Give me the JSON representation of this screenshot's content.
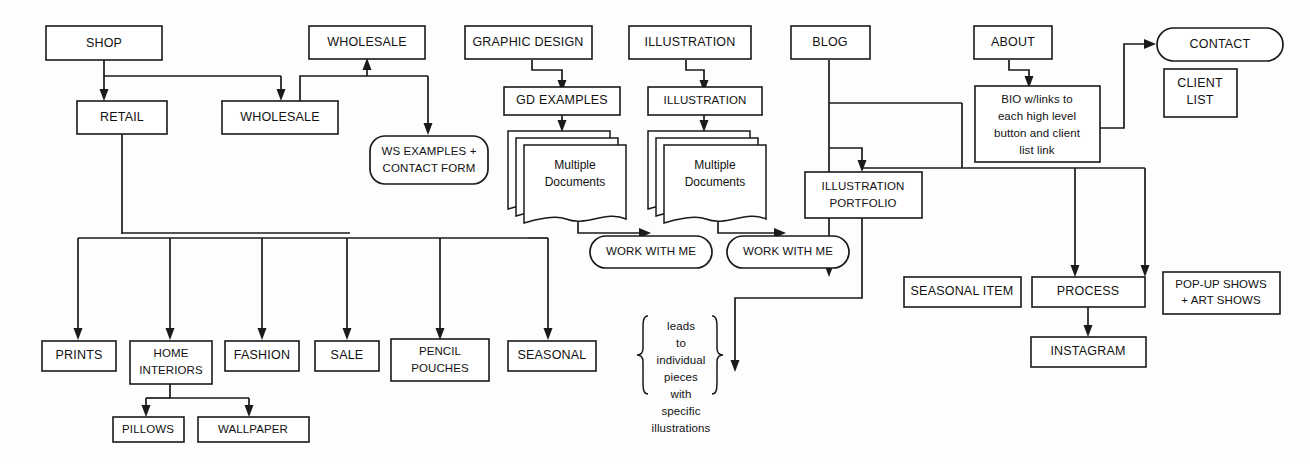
{
  "diagram": {
    "type": "flowchart",
    "background_color": "#fdfdfd",
    "line_color": "#1a1a1a",
    "text_color": "#111111"
  },
  "nodes": {
    "shop": "SHOP",
    "wholesale_top": "WHOLESALE",
    "graphic_design": "GRAPHIC DESIGN",
    "illustration_top": "ILLUSTRATION",
    "blog": "BLOG",
    "about": "ABOUT",
    "contact": "CONTACT",
    "retail": "RETAIL",
    "wholesale_second": "WHOLESALE",
    "gd_examples": "GD EXAMPLES",
    "illustration_second": "ILLUSTRATION",
    "bio_line1": "BIO w/links to",
    "bio_line2": "each high level",
    "bio_line3": "button and client",
    "bio_line4": "list link",
    "client_list_line1": "CLIENT",
    "client_list_line2": "LIST",
    "ws_examples_line1": "WS EXAMPLES +",
    "ws_examples_line2": "CONTACT FORM",
    "multiple_docs_gd_line1": "Multiple",
    "multiple_docs_gd_line2": "Documents",
    "multiple_docs_il_line1": "Multiple",
    "multiple_docs_il_line2": "Documents",
    "illustration_portfolio_line1": "ILLUSTRATION",
    "illustration_portfolio_line2": "PORTFOLIO",
    "work_with_me_gd": "WORK WITH ME",
    "work_with_me_il": "WORK WITH ME",
    "seasonal_item": "SEASONAL ITEM",
    "process": "PROCESS",
    "popup_shows_line1": "POP-UP SHOWS",
    "popup_shows_line2": "+ ART SHOWS",
    "instagram": "INSTAGRAM",
    "prints": "PRINTS",
    "home_interiors_line1": "HOME",
    "home_interiors_line2": "INTERIORS",
    "fashion": "FASHION",
    "sale": "SALE",
    "pencil_pouches_line1": "PENCIL",
    "pencil_pouches_line2": "POUCHES",
    "seasonal": "SEASONAL",
    "pillows": "PILLOWS",
    "wallpaper": "WALLPAPER",
    "brace_note_line1": "leads",
    "brace_note_line2": "to",
    "brace_note_line3": "individual",
    "brace_note_line4": "pieces",
    "brace_note_line5": "with",
    "brace_note_line6": "specific",
    "brace_note_line7": "illustrations"
  },
  "edges": [
    {
      "from": "SHOP",
      "to": "RETAIL"
    },
    {
      "from": "SHOP",
      "to": "WHOLESALE"
    },
    {
      "from": "WHOLESALE",
      "to": "WHOLESALE (top)"
    },
    {
      "from": "WHOLESALE",
      "to": "WS EXAMPLES + CONTACT FORM"
    },
    {
      "from": "GRAPHIC DESIGN",
      "to": "GD EXAMPLES"
    },
    {
      "from": "GD EXAMPLES",
      "to": "Multiple Documents"
    },
    {
      "from": "Multiple Documents",
      "to": "WORK WITH ME"
    },
    {
      "from": "ILLUSTRATION",
      "to": "ILLUSTRATION"
    },
    {
      "from": "ILLUSTRATION",
      "to": "Multiple Documents"
    },
    {
      "from": "Multiple Documents",
      "to": "WORK WITH ME"
    },
    {
      "from": "BLOG",
      "to": "ILLUSTRATION PORTFOLIO"
    },
    {
      "from": "BLOG",
      "to": "SEASONAL ITEM"
    },
    {
      "from": "ABOUT",
      "to": "BIO w/links to each high level button and client list link"
    },
    {
      "from": "BIO w/links to each high level button and client list link",
      "to": "CONTACT"
    },
    {
      "from": "BIO w/links to each high level button and client list link",
      "to": "PROCESS"
    },
    {
      "from": "BIO w/links to each high level button and client list link",
      "to": "POP-UP SHOWS + ART SHOWS"
    },
    {
      "from": "PROCESS",
      "to": "INSTAGRAM"
    },
    {
      "from": "ILLUSTRATION PORTFOLIO",
      "to": "leads to individual pieces with specific illustrations"
    },
    {
      "from": "RETAIL",
      "to": "PRINTS"
    },
    {
      "from": "RETAIL",
      "to": "HOME INTERIORS"
    },
    {
      "from": "RETAIL",
      "to": "FASHION"
    },
    {
      "from": "RETAIL",
      "to": "SALE"
    },
    {
      "from": "RETAIL",
      "to": "PENCIL POUCHES"
    },
    {
      "from": "RETAIL",
      "to": "SEASONAL"
    },
    {
      "from": "HOME INTERIORS",
      "to": "PILLOWS"
    },
    {
      "from": "HOME INTERIORS",
      "to": "WALLPAPER"
    }
  ]
}
